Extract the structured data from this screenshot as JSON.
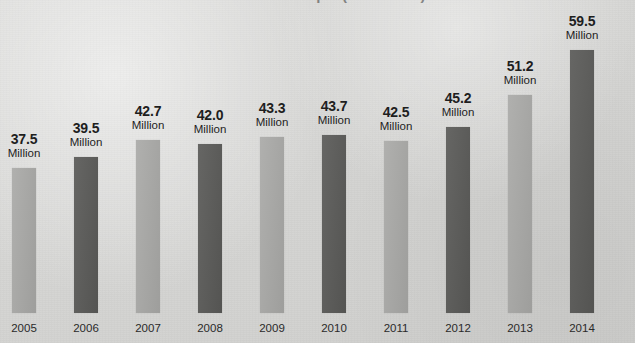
{
  "figure": {
    "title_sliver": "Number of People (in Millions)",
    "background_color": "#d6d6d4",
    "light_bar_color": "#a8a8a6",
    "dark_bar_color": "#5e5e5e",
    "unit_label": "Million"
  },
  "chart_data": {
    "type": "bar",
    "title": "",
    "subtitle": "",
    "xlabel": "",
    "ylabel": "",
    "ylim": [
      0,
      62
    ],
    "grid": false,
    "legend": "none",
    "value_suffix": "Million",
    "categories": [
      "2005",
      "2006",
      "2007",
      "2008",
      "2009",
      "2010",
      "2011",
      "2012",
      "2013",
      "2014"
    ],
    "values": [
      37.5,
      39.5,
      42.7,
      42.0,
      43.3,
      43.7,
      42.5,
      45.2,
      51.2,
      59.5
    ],
    "value_labels": [
      "37.5",
      "39.5",
      "42.7",
      "42.0",
      "43.3",
      "43.7",
      "42.5",
      "45.2",
      "51.2",
      "59.5"
    ],
    "bar_colors": [
      "#a8a8a6",
      "#5e5e5e",
      "#a8a8a6",
      "#5e5e5e",
      "#a8a8a6",
      "#5e5e5e",
      "#a8a8a6",
      "#5e5e5e",
      "#a8a8a6",
      "#5e5e5e"
    ],
    "annotations": [
      {
        "category": "2005",
        "text": "37.5 Million"
      },
      {
        "category": "2006",
        "text": "39.5 Million"
      },
      {
        "category": "2007",
        "text": "42.7 Million"
      },
      {
        "category": "2008",
        "text": "42.0 Million"
      },
      {
        "category": "2009",
        "text": "43.3 Million"
      },
      {
        "category": "2010",
        "text": "43.7 Million"
      },
      {
        "category": "2011",
        "text": "42.5 Million"
      },
      {
        "category": "2012",
        "text": "45.2 Million"
      },
      {
        "category": "2013",
        "text": "51.2 Million"
      },
      {
        "category": "2014",
        "text": "59.5 Million"
      }
    ]
  }
}
